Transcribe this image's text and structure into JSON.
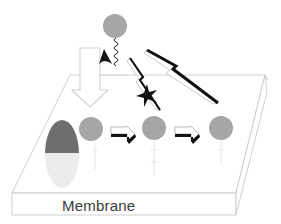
{
  "diagram": {
    "membrane_label": "Membrane",
    "colors": {
      "membrane_outline": "#c8c8c8",
      "circle_fill": "#a6a6a6",
      "receptor_top": "#6e6e6e",
      "receptor_bottom": "#ececec",
      "black": "#111111",
      "hollow_arrow_outline": "#cfcfcf",
      "label_text": "#3a3a3a"
    },
    "elements": [
      {
        "id": "ligand",
        "type": "circle",
        "description": "grey ligand circle with wavy tether"
      },
      {
        "id": "claw",
        "type": "black arrowhead"
      },
      {
        "id": "down-arrow",
        "type": "hollow arrow pointing down to receptor"
      },
      {
        "id": "receptor",
        "type": "two-tone oval on membrane"
      },
      {
        "id": "node-1",
        "type": "circle"
      },
      {
        "id": "node-2",
        "type": "circle"
      },
      {
        "id": "node-3",
        "type": "circle"
      },
      {
        "id": "arrow-1",
        "type": "3D block arrow right"
      },
      {
        "id": "arrow-2",
        "type": "3D block arrow right"
      },
      {
        "id": "bolt-long",
        "type": "lightning arrow from node-3 upward-left"
      },
      {
        "id": "bolt-short",
        "type": "lightning arrow to node-2 with black star (inhibition)"
      }
    ]
  }
}
